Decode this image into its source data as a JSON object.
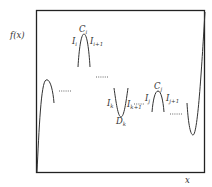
{
  "diagram": {
    "type": "function-curve-sketch",
    "axis_labels": {
      "y": "f(x)",
      "x": "x"
    },
    "labels": {
      "C_i": {
        "base": "C",
        "sub": "i"
      },
      "I_i": {
        "base": "I",
        "sub": "i"
      },
      "I_i1": {
        "base": "I",
        "sub": "i+1"
      },
      "I_k": {
        "base": "I",
        "sub": "k"
      },
      "I_k1": {
        "base": "I",
        "sub": "k+1"
      },
      "D_k": {
        "base": "D",
        "sub": "k"
      },
      "I_j": {
        "base": "I",
        "sub": "j"
      },
      "I_j1": {
        "base": "I",
        "sub": "j+1"
      },
      "C_j": {
        "base": "C",
        "sub": "j"
      }
    },
    "ellipsis": "......",
    "colors": {
      "curve": "#333333",
      "frame": "#222222",
      "text": "#333333",
      "dots": "#555555"
    }
  }
}
